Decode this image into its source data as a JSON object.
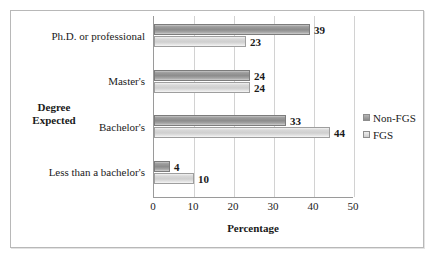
{
  "chart_data": {
    "type": "bar",
    "orientation": "horizontal",
    "title": "",
    "xlabel": "Percentage",
    "ylabel": "Degree Expected",
    "categories": [
      "Ph.D. or professional",
      "Master's",
      "Bachelor's",
      "Less than a bachelor's"
    ],
    "series": [
      {
        "name": "Non-FGS",
        "values": [
          39,
          24,
          33,
          4
        ]
      },
      {
        "name": "FGS",
        "values": [
          23,
          24,
          44,
          10
        ]
      }
    ],
    "xlim": [
      0,
      50
    ],
    "xticks": [
      0,
      10,
      20,
      30,
      40,
      50
    ],
    "xtick_labels": [
      "0",
      "10",
      "20",
      "30",
      "40",
      "50"
    ],
    "grid": "vertical",
    "legend_position": "right",
    "data_labels": true
  },
  "axis": {
    "y_title_line1": "Degree",
    "y_title_line2": "Expected",
    "x_title": "Percentage"
  },
  "legend": {
    "items": [
      {
        "label": "Non-FGS"
      },
      {
        "label": "FGS"
      }
    ]
  }
}
